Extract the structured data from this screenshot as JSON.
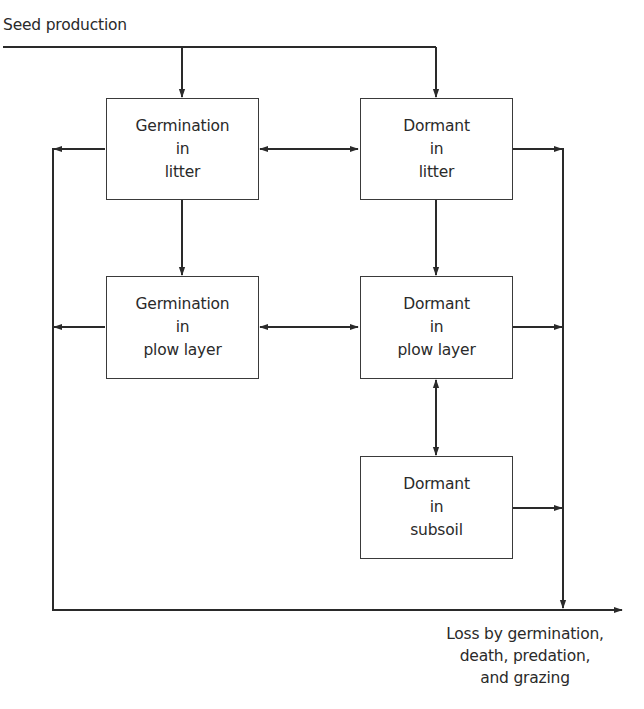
{
  "input": {
    "label": "Seed production"
  },
  "output": {
    "lines": [
      "Loss by germination,",
      "death, predation,",
      "and grazing"
    ]
  },
  "boxes": {
    "germination_litter": {
      "lines": [
        "Germination",
        "in",
        "litter"
      ]
    },
    "dormant_litter": {
      "lines": [
        "Dormant",
        "in",
        "litter"
      ]
    },
    "germination_plow": {
      "lines": [
        "Germination",
        "in",
        "plow layer"
      ]
    },
    "dormant_plow": {
      "lines": [
        "Dormant",
        "in",
        "plow layer"
      ]
    },
    "dormant_subsoil": {
      "lines": [
        "Dormant",
        "in",
        "subsoil"
      ]
    }
  },
  "flows": [
    {
      "from": "Seed production",
      "to": "Germination in litter",
      "direction": "one-way"
    },
    {
      "from": "Seed production",
      "to": "Dormant in litter",
      "direction": "one-way"
    },
    {
      "from": "Germination in litter",
      "to": "Dormant in litter",
      "direction": "two-way"
    },
    {
      "from": "Germination in litter",
      "to": "Germination in plow layer",
      "direction": "one-way"
    },
    {
      "from": "Dormant in litter",
      "to": "Dormant in plow layer",
      "direction": "one-way"
    },
    {
      "from": "Germination in plow layer",
      "to": "Dormant in plow layer",
      "direction": "two-way"
    },
    {
      "from": "Dormant in plow layer",
      "to": "Dormant in subsoil",
      "direction": "two-way"
    },
    {
      "from": "Germination in litter",
      "to": "Loss",
      "direction": "one-way"
    },
    {
      "from": "Germination in plow layer",
      "to": "Loss",
      "direction": "one-way"
    },
    {
      "from": "Dormant in litter",
      "to": "Loss",
      "direction": "one-way"
    },
    {
      "from": "Dormant in plow layer",
      "to": "Loss",
      "direction": "one-way"
    },
    {
      "from": "Dormant in subsoil",
      "to": "Loss",
      "direction": "one-way"
    }
  ]
}
